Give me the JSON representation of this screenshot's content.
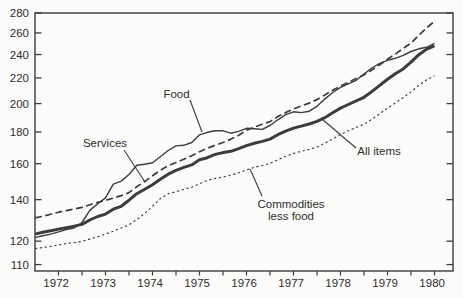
{
  "chart_data": {
    "type": "line",
    "title": "",
    "xlabel": "",
    "ylabel": "",
    "y_axis": {
      "scale": "log-ratio",
      "ticks": [
        280,
        260,
        240,
        220,
        200,
        180,
        160,
        140,
        120,
        110
      ],
      "ylim": [
        110,
        280
      ]
    },
    "x_axis": {
      "tick_labels": [
        "1972",
        "1973",
        "1974",
        "1975",
        "1976",
        "1977",
        "1978",
        "1979",
        "1980"
      ],
      "minor_tick_interval_years": 0.5,
      "x_range": [
        1972.0,
        1980.9
      ]
    },
    "legend_position": "inline-annotations",
    "grid": false,
    "x": [
      1972.0,
      1972.167,
      1972.333,
      1972.5,
      1972.667,
      1972.833,
      1973.0,
      1973.167,
      1973.333,
      1973.5,
      1973.667,
      1973.833,
      1974.0,
      1974.167,
      1974.333,
      1974.5,
      1974.667,
      1974.833,
      1975.0,
      1975.167,
      1975.333,
      1975.5,
      1975.667,
      1975.833,
      1976.0,
      1976.167,
      1976.333,
      1976.5,
      1976.667,
      1976.833,
      1977.0,
      1977.167,
      1977.333,
      1977.5,
      1977.667,
      1977.833,
      1978.0,
      1978.167,
      1978.333,
      1978.5,
      1978.667,
      1978.833,
      1979.0,
      1979.167,
      1979.333,
      1979.5,
      1979.667,
      1979.833,
      1980.0,
      1980.167,
      1980.333,
      1980.5
    ],
    "series": [
      {
        "name": "Services",
        "style": "dashed",
        "values": [
          130.8,
          131.6,
          132.6,
          133.6,
          134.4,
          135.2,
          136.0,
          137.4,
          138.6,
          139.6,
          140.8,
          142.1,
          143.7,
          146.9,
          149.7,
          153.0,
          156.1,
          158.8,
          160.7,
          162.6,
          164.8,
          167.3,
          169.4,
          171.4,
          173.1,
          175.3,
          177.8,
          181.1,
          183.3,
          185.3,
          187.1,
          190.6,
          193.4,
          196.0,
          198.2,
          200.4,
          203.0,
          206.6,
          210.2,
          213.5,
          216.4,
          219.5,
          222.5,
          226.6,
          231.1,
          235.8,
          240.4,
          245.4,
          250.4,
          257.7,
          265.0,
          271.5
        ]
      },
      {
        "name": "Food",
        "style": "solid-thin",
        "values": [
          121.6,
          122.4,
          123.2,
          124.2,
          125.3,
          126.0,
          128.6,
          134.5,
          137.9,
          140.9,
          148.3,
          150.0,
          153.7,
          159.1,
          159.7,
          160.5,
          164.2,
          168.0,
          170.9,
          171.3,
          173.1,
          178.1,
          179.8,
          180.8,
          180.8,
          179.2,
          180.4,
          182.5,
          182.2,
          181.7,
          184.4,
          188.3,
          191.9,
          194.0,
          193.4,
          194.4,
          198.0,
          203.4,
          208.4,
          212.5,
          215.3,
          218.1,
          223.2,
          228.3,
          232.2,
          234.8,
          236.6,
          239.2,
          242.7,
          245.1,
          246.5,
          250.2
        ]
      },
      {
        "name": "All items",
        "style": "solid-thick",
        "values": [
          123.2,
          124.0,
          124.7,
          125.5,
          126.2,
          126.9,
          127.7,
          129.8,
          131.5,
          132.7,
          135.1,
          136.6,
          139.7,
          143.1,
          145.5,
          148.0,
          151.0,
          153.9,
          156.1,
          157.8,
          159.3,
          162.3,
          163.6,
          165.6,
          166.7,
          167.5,
          169.2,
          171.1,
          172.6,
          173.8,
          175.3,
          178.2,
          180.6,
          182.6,
          184.0,
          185.4,
          187.2,
          189.8,
          193.3,
          196.7,
          199.3,
          202.0,
          204.7,
          209.1,
          214.1,
          218.9,
          223.4,
          227.5,
          233.2,
          239.8,
          244.9,
          247.8
        ]
      },
      {
        "name": "Commodities less food",
        "style": "dotted",
        "values": [
          116.7,
          117.2,
          117.7,
          118.3,
          118.9,
          119.4,
          119.9,
          120.9,
          122.0,
          123.2,
          124.5,
          126.0,
          127.5,
          130.0,
          133.0,
          136.6,
          140.5,
          143.1,
          144.2,
          145.4,
          146.6,
          148.5,
          150.4,
          151.5,
          152.2,
          153.3,
          154.7,
          156.3,
          157.8,
          158.9,
          160.1,
          162.3,
          164.5,
          166.2,
          167.5,
          168.7,
          170.2,
          172.6,
          175.4,
          178.3,
          180.8,
          183.0,
          185.2,
          188.7,
          192.6,
          196.6,
          200.5,
          204.5,
          208.9,
          214.0,
          218.5,
          221.8
        ]
      }
    ],
    "annotations": [
      {
        "lines": [
          "Food"
        ],
        "tx": 176.5,
        "ty": 94,
        "leader": [
          190,
          100,
          202,
          132
        ]
      },
      {
        "lines": [
          "Services"
        ],
        "tx": 105,
        "ty": 143,
        "leader": [
          124,
          150,
          145,
          182
        ]
      },
      {
        "lines": [
          "All items"
        ],
        "tx": 379,
        "ty": 151,
        "leader": [
          356,
          148,
          322,
          119
        ]
      },
      {
        "lines": [
          "Commodities",
          "less food"
        ],
        "tx": 291,
        "ty": 204,
        "leader": [
          262,
          196,
          250,
          169
        ]
      }
    ],
    "colors": {
      "line": "#3c3c3c",
      "text": "#2e2e2e",
      "background": "#fcfcfa"
    }
  }
}
